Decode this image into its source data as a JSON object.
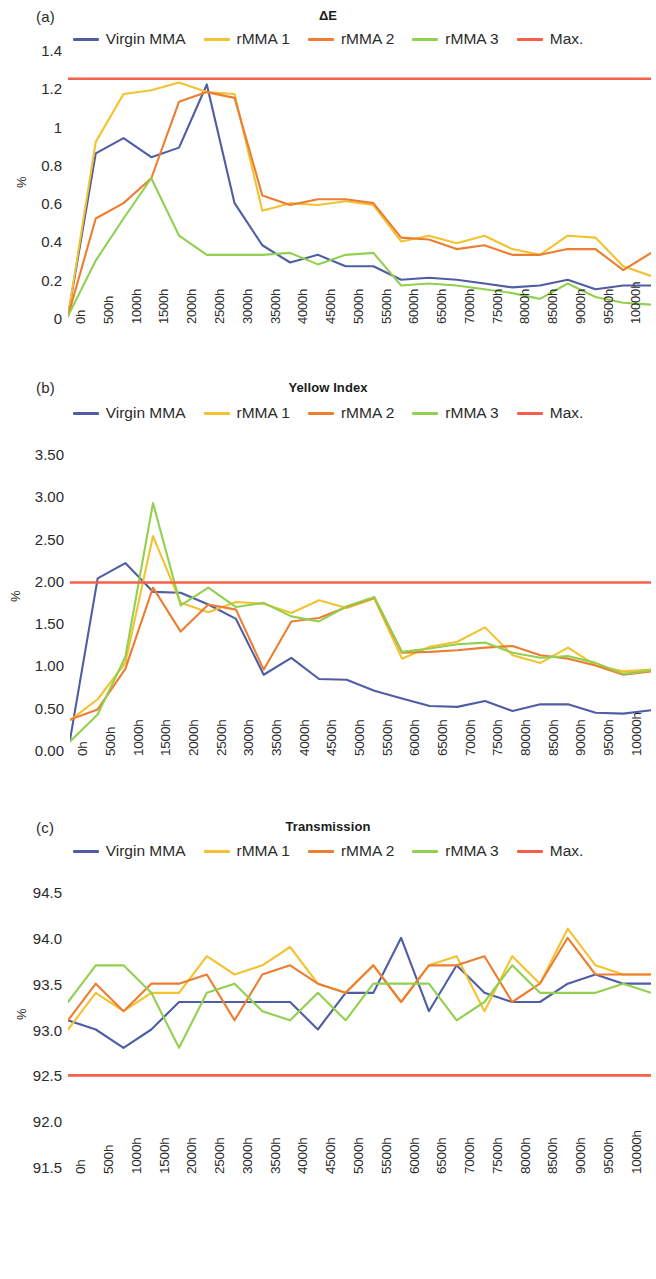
{
  "figure": {
    "y_axis_label": "%",
    "x_categories": [
      "0h",
      "500h",
      "1000h",
      "1500h",
      "2000h",
      "2500h",
      "3000h",
      "3500h",
      "4000h",
      "4500h",
      "5000h",
      "5500h",
      "6000h",
      "6500h",
      "7000h",
      "7500h",
      "8000h",
      "8500h",
      "9000h",
      "9500h",
      "10000h",
      "10500h"
    ],
    "series_colors": {
      "virgin_mma": "#4f5da5",
      "rmma_1": "#f2c230",
      "rmma_2": "#ed7d31",
      "rmma_3": "#92d050",
      "max": "#f4604a"
    },
    "legend_labels": {
      "virgin_mma": "Virgin MMA",
      "rmma_1": "rMMA 1",
      "rmma_2": "rMMA 2",
      "rmma_3": "rMMA 3",
      "max": "Max."
    }
  },
  "panels": [
    {
      "tag": "(a)",
      "title": "ΔE"
    },
    {
      "tag": "(b)",
      "title": "Yellow Index"
    },
    {
      "tag": "(c)",
      "title": "Transmission"
    }
  ],
  "chart_data": [
    {
      "type": "line",
      "panel": "(a)",
      "title": "ΔE",
      "xlabel": "",
      "ylabel": "%",
      "ylim": [
        0,
        1.4
      ],
      "yticks": [
        0,
        0.2,
        0.4,
        0.6,
        0.8,
        1,
        1.2,
        1.4
      ],
      "ytick_labels": [
        "0",
        "0.2",
        "0.4",
        "0.6",
        "0.8",
        "1",
        "1.2",
        "1.4"
      ],
      "grid": false,
      "legend_position": "top",
      "categories": [
        "0h",
        "500h",
        "1000h",
        "1500h",
        "2000h",
        "2500h",
        "3000h",
        "3500h",
        "4000h",
        "4500h",
        "5000h",
        "5500h",
        "6000h",
        "6500h",
        "7000h",
        "7500h",
        "8000h",
        "8500h",
        "9000h",
        "9500h",
        "10000h",
        "10500h"
      ],
      "series": [
        {
          "name": "Virgin MMA",
          "color": "#4f5da5",
          "values": [
            0.01,
            0.86,
            0.94,
            0.84,
            0.89,
            1.22,
            0.6,
            0.38,
            0.29,
            0.33,
            0.27,
            0.27,
            0.2,
            0.21,
            0.2,
            0.18,
            0.16,
            0.17,
            0.2,
            0.15,
            0.17,
            0.17
          ]
        },
        {
          "name": "rMMA 1",
          "color": "#f2c230",
          "values": [
            0.01,
            0.92,
            1.17,
            1.19,
            1.23,
            1.18,
            1.17,
            0.56,
            0.6,
            0.59,
            0.61,
            0.59,
            0.4,
            0.43,
            0.39,
            0.43,
            0.36,
            0.33,
            0.43,
            0.42,
            0.27,
            0.22
          ]
        },
        {
          "name": "rMMA 2",
          "color": "#ed7d31",
          "values": [
            0.01,
            0.52,
            0.6,
            0.73,
            1.13,
            1.18,
            1.15,
            0.64,
            0.59,
            0.62,
            0.62,
            0.6,
            0.42,
            0.41,
            0.36,
            0.38,
            0.33,
            0.33,
            0.36,
            0.36,
            0.25,
            0.34
          ]
        },
        {
          "name": "rMMA 3",
          "color": "#92d050",
          "values": [
            0.01,
            0.3,
            0.52,
            0.73,
            0.43,
            0.33,
            0.33,
            0.33,
            0.34,
            0.28,
            0.33,
            0.34,
            0.17,
            0.18,
            0.17,
            0.15,
            0.13,
            0.1,
            0.18,
            0.11,
            0.08,
            0.07
          ]
        },
        {
          "name": "Max.",
          "color": "#f4604a",
          "type": "threshold",
          "values": [
            1.25,
            1.25,
            1.25,
            1.25,
            1.25,
            1.25,
            1.25,
            1.25,
            1.25,
            1.25,
            1.25,
            1.25,
            1.25,
            1.25,
            1.25,
            1.25,
            1.25,
            1.25,
            1.25,
            1.25,
            1.25,
            1.25
          ]
        }
      ]
    },
    {
      "type": "line",
      "panel": "(b)",
      "title": "Yellow Index",
      "xlabel": "",
      "ylabel": "%",
      "ylim": [
        0,
        3.5
      ],
      "yticks": [
        0,
        0.5,
        1.0,
        1.5,
        2.0,
        2.5,
        3.0,
        3.5
      ],
      "ytick_labels": [
        "0.00",
        "0.50",
        "1.00",
        "1.50",
        "2.00",
        "2.50",
        "3.00",
        "3.50"
      ],
      "grid": false,
      "legend_position": "top",
      "categories": [
        "0h",
        "500h",
        "1000h",
        "1500h",
        "2000h",
        "2500h",
        "3000h",
        "3500h",
        "4000h",
        "4500h",
        "5000h",
        "5500h",
        "6000h",
        "6500h",
        "7000h",
        "7500h",
        "8000h",
        "8500h",
        "9000h",
        "9500h",
        "10000h",
        "10500h"
      ],
      "series": [
        {
          "name": "Virgin MMA",
          "color": "#4f5da5",
          "values": [
            0.12,
            2.03,
            2.21,
            1.87,
            1.86,
            1.72,
            1.55,
            0.89,
            1.09,
            0.84,
            0.83,
            0.7,
            0.61,
            0.52,
            0.51,
            0.58,
            0.46,
            0.54,
            0.54,
            0.44,
            0.43,
            0.47
          ]
        },
        {
          "name": "rMMA 1",
          "color": "#f2c230",
          "values": [
            0.35,
            0.6,
            1.03,
            2.53,
            1.74,
            1.63,
            1.75,
            1.73,
            1.62,
            1.77,
            1.68,
            1.79,
            1.08,
            1.22,
            1.28,
            1.45,
            1.12,
            1.03,
            1.21,
            1.0,
            0.93,
            0.95
          ]
        },
        {
          "name": "rMMA 2",
          "color": "#ed7d31",
          "values": [
            0.36,
            0.48,
            0.96,
            1.92,
            1.4,
            1.72,
            1.66,
            0.95,
            1.52,
            1.56,
            1.69,
            1.8,
            1.15,
            1.16,
            1.18,
            1.21,
            1.23,
            1.12,
            1.08,
            1.0,
            0.89,
            0.93
          ]
        },
        {
          "name": "rMMA 3",
          "color": "#92d050",
          "values": [
            0.1,
            0.42,
            1.1,
            2.92,
            1.71,
            1.92,
            1.69,
            1.74,
            1.58,
            1.52,
            1.7,
            1.81,
            1.16,
            1.2,
            1.25,
            1.27,
            1.15,
            1.09,
            1.11,
            1.03,
            0.9,
            0.94
          ]
        },
        {
          "name": "Max.",
          "color": "#f4604a",
          "type": "threshold",
          "values": [
            1.98,
            1.98,
            1.98,
            1.98,
            1.98,
            1.98,
            1.98,
            1.98,
            1.98,
            1.98,
            1.98,
            1.98,
            1.98,
            1.98,
            1.98,
            1.98,
            1.98,
            1.98,
            1.98,
            1.98,
            1.98,
            1.98
          ]
        }
      ]
    },
    {
      "type": "line",
      "panel": "(c)",
      "title": "Transmission",
      "xlabel": "",
      "ylabel": "%",
      "ylim": [
        91.5,
        94.5
      ],
      "yticks": [
        91.5,
        92.0,
        92.5,
        93.0,
        93.5,
        94.0,
        94.5
      ],
      "ytick_labels": [
        "91.5",
        "92.0",
        "92.5",
        "93.0",
        "93.5",
        "94.0",
        "94.5"
      ],
      "grid": false,
      "legend_position": "top",
      "categories": [
        "0h",
        "500h",
        "1000h",
        "1500h",
        "2000h",
        "2500h",
        "3000h",
        "3500h",
        "4000h",
        "4500h",
        "5000h",
        "5500h",
        "6000h",
        "6500h",
        "7000h",
        "7500h",
        "8000h",
        "8500h",
        "9000h",
        "9500h",
        "10000h",
        "10500h"
      ],
      "series": [
        {
          "name": "Virgin MMA",
          "color": "#4f5da5",
          "values": [
            93.1,
            93.0,
            92.8,
            93.0,
            93.3,
            93.3,
            93.3,
            93.3,
            93.3,
            93.0,
            93.4,
            93.4,
            94.0,
            93.2,
            93.7,
            93.4,
            93.3,
            93.3,
            93.5,
            93.6,
            93.5,
            93.5
          ]
        },
        {
          "name": "rMMA 1",
          "color": "#f2c230",
          "values": [
            93.0,
            93.4,
            93.2,
            93.4,
            93.4,
            93.8,
            93.6,
            93.7,
            93.9,
            93.5,
            93.4,
            93.7,
            93.3,
            93.7,
            93.8,
            93.2,
            93.8,
            93.5,
            94.1,
            93.7,
            93.6,
            93.6
          ]
        },
        {
          "name": "rMMA 2",
          "color": "#ed7d31",
          "values": [
            93.1,
            93.5,
            93.2,
            93.5,
            93.5,
            93.6,
            93.1,
            93.6,
            93.7,
            93.5,
            93.4,
            93.7,
            93.3,
            93.7,
            93.7,
            93.8,
            93.3,
            93.5,
            94.0,
            93.6,
            93.6,
            93.6
          ]
        },
        {
          "name": "rMMA 3",
          "color": "#92d050",
          "values": [
            93.3,
            93.7,
            93.7,
            93.4,
            92.8,
            93.4,
            93.5,
            93.2,
            93.1,
            93.4,
            93.1,
            93.5,
            93.5,
            93.5,
            93.1,
            93.3,
            93.7,
            93.4,
            93.4,
            93.4,
            93.5,
            93.4
          ]
        },
        {
          "name": "Max.",
          "color": "#f4604a",
          "type": "threshold",
          "values": [
            92.5,
            92.5,
            92.5,
            92.5,
            92.5,
            92.5,
            92.5,
            92.5,
            92.5,
            92.5,
            92.5,
            92.5,
            92.5,
            92.5,
            92.5,
            92.5,
            92.5,
            92.5,
            92.5,
            92.5,
            92.5,
            92.5
          ]
        }
      ]
    }
  ]
}
